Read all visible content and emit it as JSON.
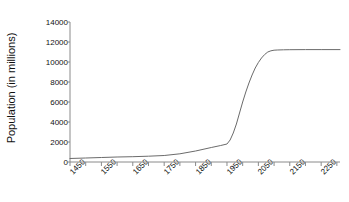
{
  "chart_data": {
    "type": "line",
    "title": "",
    "xlabel": "",
    "ylabel": "Population (in millions)",
    "xlim": [
      1450,
      2310
    ],
    "ylim": [
      0,
      14000
    ],
    "grid": false,
    "legend": null,
    "x_tick_labels": [
      "1450",
      "1550",
      "1650",
      "1750",
      "1850",
      "1950",
      "2050",
      "2150",
      "2250"
    ],
    "x_tick_values": [
      1450,
      1550,
      1650,
      1750,
      1850,
      1950,
      2050,
      2150,
      2250
    ],
    "x_minor_tick_interval": 50,
    "y_tick_labels": [
      "0",
      "2000",
      "4000",
      "6000",
      "8000",
      "10000",
      "12000",
      "14000"
    ],
    "y_tick_values": [
      0,
      2000,
      4000,
      6000,
      8000,
      10000,
      12000,
      14000
    ],
    "line_color": "#6b6b6b",
    "axis_color": "#8a8a8a",
    "series": [
      {
        "name": "World population",
        "x": [
          1450,
          1500,
          1550,
          1600,
          1650,
          1700,
          1750,
          1800,
          1850,
          1900,
          1930,
          1950,
          1960,
          1970,
          1980,
          1990,
          2000,
          2010,
          2020,
          2030,
          2040,
          2050,
          2060,
          2070,
          2080,
          2090,
          2100,
          2110,
          2130,
          2150,
          2200,
          2250,
          2310
        ],
        "values": [
          350,
          400,
          450,
          500,
          530,
          580,
          650,
          820,
          1100,
          1450,
          1650,
          1800,
          2200,
          2900,
          3800,
          4900,
          6000,
          7000,
          7900,
          8700,
          9400,
          9950,
          10400,
          10750,
          11000,
          11120,
          11180,
          11200,
          11220,
          11230,
          11240,
          11240,
          11240
        ]
      }
    ]
  }
}
